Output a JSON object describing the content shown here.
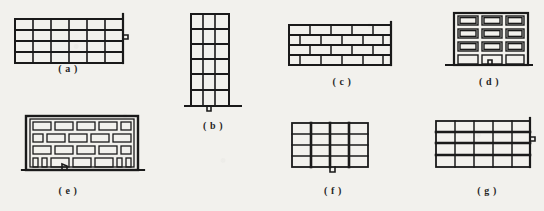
{
  "sheet": {
    "title": "Structural damage pattern figures",
    "background_color": "#f2f1ed",
    "ink_color": "#1a1a1a"
  },
  "figures": [
    {
      "id": "a",
      "caption": "( a )",
      "kind": "frame-grid-wall",
      "description": "Rectangular framed wall elevation, regular grid bays",
      "rows": 4,
      "cols": 6,
      "crack": "right-edge-zigzag",
      "ground_line": false
    },
    {
      "id": "b",
      "caption": "( b )",
      "kind": "tall-narrow-frame",
      "description": "Tall slender multi-storey frame elevation",
      "rows": 6,
      "cols": 3,
      "crack": "base-zigzag",
      "ground_line": true
    },
    {
      "id": "c",
      "caption": "( c )",
      "kind": "running-bond-masonry",
      "description": "Masonry wall in running bond, staggered courses",
      "rows": 4,
      "cols": 5,
      "crack": "none",
      "ground_line": false
    },
    {
      "id": "d",
      "caption": "( d )",
      "kind": "infill-frame",
      "description": "Frame with double-outlined infill panels",
      "rows": 4,
      "cols": 3,
      "crack": "bottom-bay-zigzag",
      "ground_line": true
    },
    {
      "id": "e",
      "caption": "( e )",
      "kind": "infill-frame-wide",
      "description": "Wide frame with staggered infill panels and bottom columns",
      "rows": 4,
      "cols": 5,
      "crack": "bottom-bay-zigzag",
      "ground_line": true
    },
    {
      "id": "f",
      "caption": "( f )",
      "kind": "column-dominant-frame",
      "description": "Frame with heavy vertical columns and light floor lines",
      "rows": 4,
      "cols": 4,
      "crack": "bottom-center-zigzag",
      "ground_line": false
    },
    {
      "id": "g",
      "caption": "( g )",
      "kind": "slab-dominant-frame",
      "description": "Frame with heavy horizontal floor bands and light verticals",
      "rows": 4,
      "cols": 5,
      "crack": "right-edge-zigzag",
      "ground_line": false
    }
  ]
}
